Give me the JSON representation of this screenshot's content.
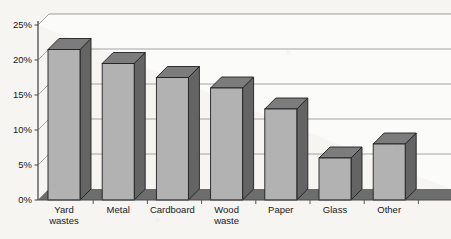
{
  "chart_data": {
    "type": "bar",
    "title": "",
    "subtitle": "",
    "xlabel": "",
    "ylabel": "",
    "categories": [
      "Yard wastes",
      "Metal",
      "Cardboard",
      "Wood waste",
      "Paper",
      "Glass",
      "Other"
    ],
    "category_lines": [
      [
        "Yard",
        "wastes"
      ],
      [
        "Metal"
      ],
      [
        "Cardboard"
      ],
      [
        "Wood",
        "waste"
      ],
      [
        "Paper"
      ],
      [
        "Glass"
      ],
      [
        "Other"
      ]
    ],
    "values": [
      21.5,
      19.5,
      17.5,
      16,
      13,
      6,
      8
    ],
    "value_labels": [
      "21.5%",
      "19.5%",
      "17.5%",
      "16%",
      "13%",
      "6%",
      "8%"
    ],
    "ylim": [
      0,
      25
    ],
    "ytick_values": [
      0,
      5,
      10,
      15,
      20,
      25
    ],
    "ytick_labels": [
      "0%",
      "5%",
      "10%",
      "15%",
      "20%",
      "25%"
    ],
    "grid": true,
    "legend": false,
    "legend_position": "none",
    "projection": "3d-column",
    "series": [
      {
        "name": "Percent of municipal solid waste",
        "values": [
          21.5,
          19.5,
          17.5,
          16,
          13,
          6,
          8
        ]
      }
    ],
    "annotations": []
  },
  "style": {
    "background_color": "#f6f5f2",
    "plot_wall_color": "#fbfbf9",
    "bar_front_color": "#b2b2b2",
    "bar_side_color": "#646464",
    "bar_top_color": "#7c7c7c",
    "bar_outline_color": "#1f1f22",
    "floor_color": "#6d6d6d",
    "axis_color": "#4a4a4d",
    "gridline_color": "#9a9a9a",
    "tick_color": "#55555a"
  },
  "caption": {
    "figure_label": "",
    "text": ""
  }
}
